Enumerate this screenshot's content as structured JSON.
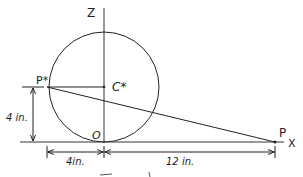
{
  "diagram": {
    "labels": {
      "z_axis": "Z",
      "x_axis": "X",
      "p_star": "P*",
      "c_star": "C*",
      "origin": "O",
      "p": "P",
      "dim_vertical": "4 in.",
      "dim_left": "4in.",
      "dim_right": "12 in.",
      "caption": "Fig."
    },
    "geometry": {
      "circle_center": [
        104,
        87
      ],
      "circle_radius": 55,
      "origin": [
        104,
        142
      ],
      "p_star": [
        47,
        87
      ],
      "c_star": [
        104,
        87
      ],
      "p": [
        275,
        142
      ]
    },
    "colors": {
      "line": "#222222",
      "background": "#ffffff"
    }
  }
}
